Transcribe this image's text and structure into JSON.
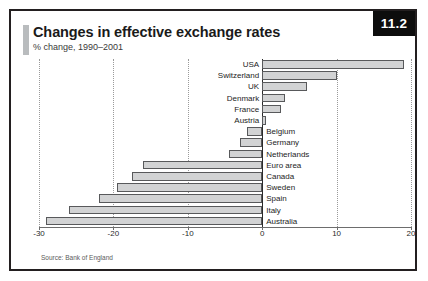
{
  "badge": {
    "label": "11.2"
  },
  "header": {
    "title": "Changes in effective exchange rates",
    "subtitle": "% change, 1990–2001"
  },
  "source": {
    "text": "Source: Bank of England"
  },
  "chart_data": {
    "type": "bar",
    "orientation": "horizontal",
    "title": "Changes in effective exchange rates",
    "subtitle": "% change, 1990–2001",
    "xlabel": "",
    "ylabel": "",
    "xlim": [
      -30,
      20
    ],
    "ticks": [
      -30,
      -20,
      -10,
      0,
      10,
      20
    ],
    "tick_labels": [
      "-30",
      "-20",
      "-10",
      "0",
      "10",
      "20"
    ],
    "grid": true,
    "legend": null,
    "bar_color": "#d2d3d4",
    "bar_edge_color": "#58595b",
    "categories": [
      "USA",
      "Switzerland",
      "UK",
      "Denmark",
      "France",
      "Austria",
      "Belgium",
      "Germany",
      "Netherlands",
      "Euro area",
      "Canada",
      "Sweden",
      "Spain",
      "Italy",
      "Australia"
    ],
    "values": [
      19,
      10,
      6,
      3,
      2.5,
      0.5,
      -2,
      -3,
      -4.5,
      -16,
      -17.5,
      -19.5,
      -22,
      -26,
      -29
    ],
    "source": "Source: Bank of England"
  }
}
